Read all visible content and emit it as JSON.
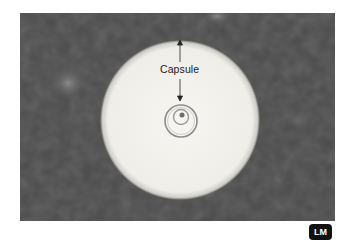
{
  "figure": {
    "annotation_label": "Capsule",
    "badge_label": "LM",
    "colors": {
      "background_field": "#4a4a4a",
      "halo": "#f3f2ee",
      "badge_bg": "#111111",
      "badge_text": "#ffffff"
    }
  }
}
